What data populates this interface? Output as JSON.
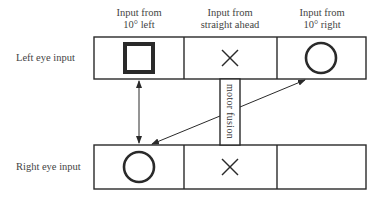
{
  "columns": [
    {
      "line1": "Input from",
      "line2": "10° left"
    },
    {
      "line1": "Input from",
      "line2": "straight ahead"
    },
    {
      "line1": "Input from",
      "line2": "10° right"
    }
  ],
  "rows": [
    {
      "label": "Left eye input",
      "cells": [
        "square",
        "cross",
        "circle"
      ]
    },
    {
      "label": "Right eye input",
      "cells": [
        "circle",
        "cross",
        "empty"
      ]
    }
  ],
  "fusion_label": "motor fusion",
  "colors": {
    "stroke": "#2a2a2a",
    "text": "#444444",
    "background": "#ffffff"
  }
}
